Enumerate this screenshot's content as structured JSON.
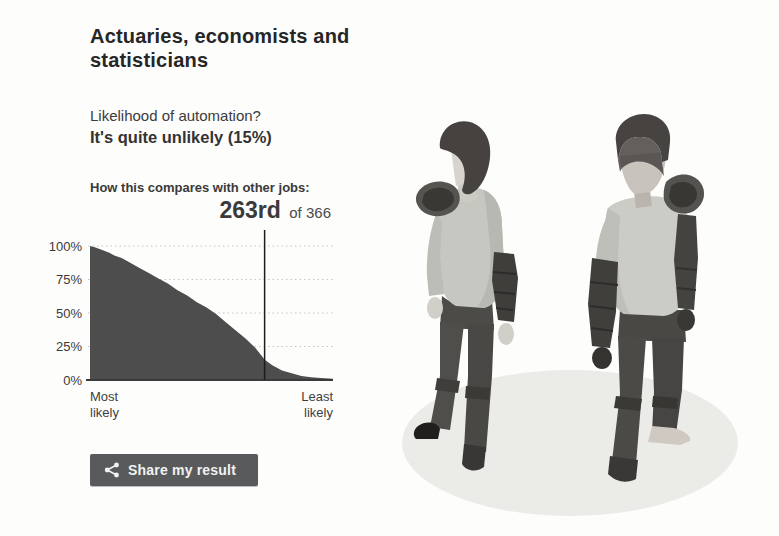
{
  "page": {
    "title": "Actuaries, economists and statisticians",
    "likelihood_question": "Likelihood of automation?",
    "likelihood_answer": "It's quite unlikely (15%)",
    "comparison_label": "How this compares with other jobs:",
    "rank": "263rd",
    "rank_suffix": "of 366",
    "share_button_label": "Share my result",
    "icons": {
      "share": "share-icon"
    }
  },
  "chart_data": {
    "type": "area",
    "title": "How this compares with other jobs",
    "xlabel_left": "Most likely",
    "xlabel_right": "Least likely",
    "yticks": [
      "100%",
      "75%",
      "50%",
      "25%",
      "0%"
    ],
    "ylim": [
      0,
      100
    ],
    "x_jobs_range": [
      1,
      366
    ],
    "grid": "dotted-horizontal",
    "marker": {
      "rank": 263,
      "total": 366,
      "value_pct": 15
    },
    "points": [
      [
        0.0,
        100
      ],
      [
        0.02,
        99
      ],
      [
        0.05,
        97
      ],
      [
        0.08,
        95
      ],
      [
        0.1,
        93
      ],
      [
        0.13,
        91
      ],
      [
        0.16,
        88
      ],
      [
        0.2,
        84
      ],
      [
        0.24,
        80
      ],
      [
        0.28,
        76
      ],
      [
        0.32,
        72
      ],
      [
        0.36,
        67
      ],
      [
        0.4,
        63
      ],
      [
        0.44,
        58
      ],
      [
        0.48,
        54
      ],
      [
        0.52,
        49
      ],
      [
        0.56,
        43
      ],
      [
        0.6,
        37
      ],
      [
        0.64,
        31
      ],
      [
        0.68,
        24
      ],
      [
        0.72,
        15
      ],
      [
        0.75,
        11
      ],
      [
        0.79,
        7
      ],
      [
        0.83,
        5
      ],
      [
        0.87,
        3
      ],
      [
        0.91,
        2
      ],
      [
        0.95,
        1.5
      ],
      [
        1.0,
        1
      ]
    ],
    "colors": {
      "fill": "#4d4d4d",
      "marker_line": "#1d1d1d",
      "grid": "#c4c4c4",
      "axis": "#3a3a3a",
      "tick_text": "#3a3a3a"
    }
  }
}
